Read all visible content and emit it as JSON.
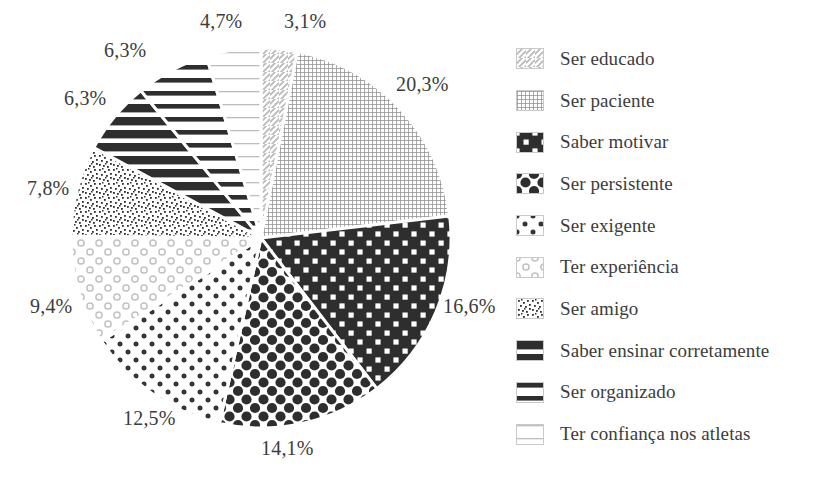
{
  "chart_data": {
    "type": "pie",
    "title": "",
    "xlabel": "",
    "ylabel": "",
    "legend_position": "right",
    "grid": false,
    "start_angle_deg": 0,
    "direction": "clockwise",
    "value_suffix": "%",
    "decimal_separator": ",",
    "categories": [
      "Ser educado",
      "Ser paciente",
      "Saber motivar",
      "Ser persistente",
      "Ser exigente",
      "Ter experiência",
      "Ser amigo",
      "Saber ensinar corretamente",
      "Ser organizado",
      "Ter confiança nos atletas"
    ],
    "values": [
      3.1,
      20.3,
      16.6,
      14.1,
      12.5,
      9.4,
      7.8,
      6.3,
      6.3,
      4.7
    ],
    "labels": [
      "3,1%",
      "20,3%",
      "16,6%",
      "14,1%",
      "12,5%",
      "9,4%",
      "7,8%",
      "6,3%",
      "6,3%",
      "4,7%"
    ],
    "patterns": [
      "diagonal-hatch-light",
      "fine-grid-gray",
      "checkerboard-dark",
      "large-dots-dark",
      "medium-dots-dark",
      "small-circles-light",
      "fine-speckle",
      "thick-horizontal-bars",
      "thin-horizontal-bars",
      "light-horizontal-lines"
    ]
  },
  "pie": {
    "center_x": 261,
    "center_y": 238,
    "radius": 190,
    "slice_labels": [
      {
        "text": "3,1%",
        "x": 284,
        "y": 10
      },
      {
        "text": "20,3%",
        "x": 396,
        "y": 73
      },
      {
        "text": "16,6%",
        "x": 443,
        "y": 295
      },
      {
        "text": "14,1%",
        "x": 261,
        "y": 437
      },
      {
        "text": "12,5%",
        "x": 123,
        "y": 407
      },
      {
        "text": "9,4%",
        "x": 30,
        "y": 295
      },
      {
        "text": "7,8%",
        "x": 27,
        "y": 177
      },
      {
        "text": "6,3%",
        "x": 64,
        "y": 87
      },
      {
        "text": "6,3%",
        "x": 104,
        "y": 39
      },
      {
        "text": "4,7%",
        "x": 200,
        "y": 10
      }
    ]
  },
  "legend": {
    "items": [
      {
        "label": "Ser educado",
        "pattern": "diagonal-hatch-light"
      },
      {
        "label": " Ser paciente",
        "pattern": "fine-grid-gray"
      },
      {
        "label": "Saber motivar",
        "pattern": "checkerboard-dark"
      },
      {
        "label": "Ser persistente",
        "pattern": "large-dots-dark"
      },
      {
        "label": "Ser exigente",
        "pattern": "medium-dots-dark"
      },
      {
        "label": "Ter experiência",
        "pattern": "small-circles-light"
      },
      {
        "label": "Ser amigo",
        "pattern": "fine-speckle"
      },
      {
        "label": "Saber ensinar corretamente",
        "pattern": "thick-horizontal-bars"
      },
      {
        "label": "Ser organizado",
        "pattern": "thin-horizontal-bars"
      },
      {
        "label": "Ter confiança nos atletas",
        "pattern": "light-horizontal-lines"
      }
    ]
  },
  "colors": {
    "text": "#3c3c3c",
    "background": "#ffffff",
    "dark_fill": "#2e2e2e",
    "mid_gray": "#8a8a8a",
    "light_gray": "#cfcfcf",
    "separator": "#ffffff"
  }
}
